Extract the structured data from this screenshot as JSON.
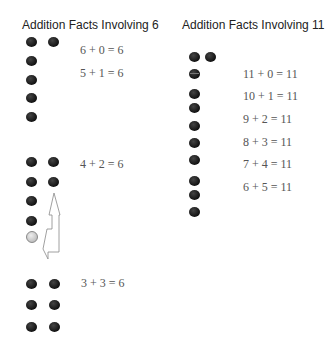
{
  "left_panel": {
    "title": "Addition Facts Involving 6",
    "equations": [
      "6 + 0 = 6",
      "5 + 1 = 6",
      "4 + 2 = 6",
      "3 + 3 = 6"
    ]
  },
  "right_panel": {
    "title": "Addition Facts Involving 11",
    "equations": [
      "11 + 0 = 11",
      "10 + 1 = 11",
      "9 + 2 = 11",
      "8 + 3 = 11",
      "7 + 4 = 11",
      "6 + 5 = 11"
    ]
  }
}
